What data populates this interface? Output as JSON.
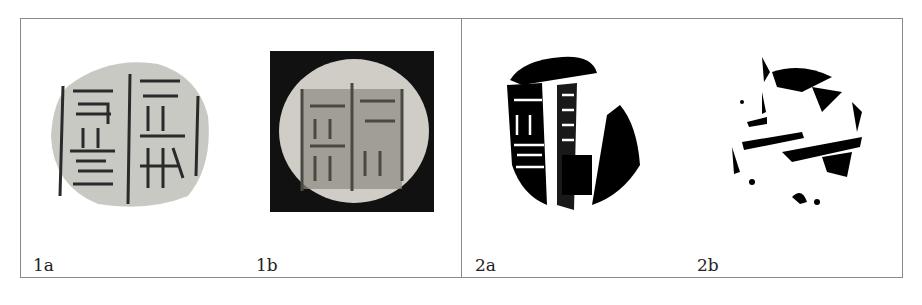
{
  "figure": {
    "panels": [
      {
        "id": "1a",
        "label": "1a",
        "description": "seal impression, grey stone surface with carved characters"
      },
      {
        "id": "1b",
        "label": "1b",
        "description": "photograph of round seal on black background"
      },
      {
        "id": "2a",
        "label": "2a",
        "description": "binarized black-and-white rubbing"
      },
      {
        "id": "2b",
        "label": "2b",
        "description": "binarized sparse black-and-white rubbing"
      }
    ]
  }
}
